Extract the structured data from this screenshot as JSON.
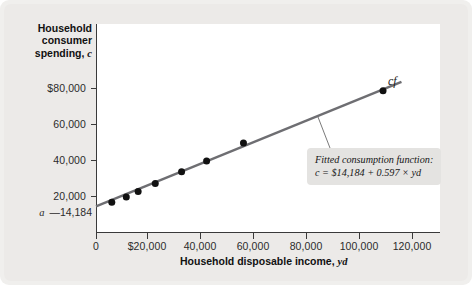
{
  "axes": {
    "y_title_line1": "Household",
    "y_title_line2": "consumer",
    "y_title_line3": "spending,",
    "y_title_symbol": "c",
    "x_title": "Household disposable income,",
    "x_title_symbol": "yd",
    "intercept_symbol": "a",
    "intercept_value": "—14,184"
  },
  "annotations": {
    "curve_label": "cf",
    "note_line1": "Fitted consumption function:",
    "note_line2": "c = $14,184 + 0.597 × yd"
  },
  "colors": {
    "line": "#6e6e72",
    "point": "#111111",
    "axis": "#3a3a3a",
    "panel": "#ffffff",
    "card": "#f0efed",
    "note_bg": "#e4e3e1"
  },
  "chart_data": {
    "type": "scatter",
    "title": "",
    "xlabel": "Household disposable income, yd",
    "ylabel": "Household consumer spending, c",
    "xlim": [
      0,
      130000
    ],
    "ylim": [
      0,
      95000
    ],
    "grid": false,
    "legend": "none",
    "xticks": [
      0,
      20000,
      40000,
      60000,
      80000,
      100000,
      120000
    ],
    "xticklabels": [
      "0",
      "$20,000",
      "40,000",
      "60,000",
      "80,000",
      "100,000",
      "120,000"
    ],
    "yticks": [
      20000,
      40000,
      60000,
      80000
    ],
    "yticklabels": [
      "20,000",
      "40,000",
      "60,000",
      "$80,000"
    ],
    "points": [
      {
        "x": 6000,
        "y": 16500
      },
      {
        "x": 11500,
        "y": 19500
      },
      {
        "x": 16000,
        "y": 22500
      },
      {
        "x": 22500,
        "y": 27000
      },
      {
        "x": 32500,
        "y": 33500
      },
      {
        "x": 42000,
        "y": 39500
      },
      {
        "x": 56000,
        "y": 49500
      },
      {
        "x": 109000,
        "y": 78500
      }
    ],
    "fit_line": {
      "label": "cf",
      "intercept": 14184,
      "slope": 0.597,
      "equation": "c = $14,184 + 0.597 × yd",
      "x_start": 0,
      "x_end": 116000
    }
  }
}
